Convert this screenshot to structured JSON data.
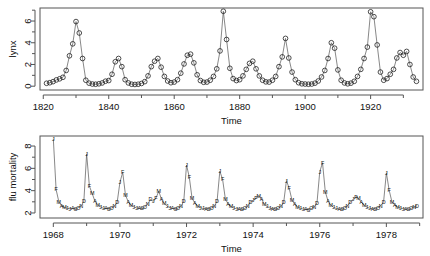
{
  "figure": {
    "panels": [
      "lynx",
      "flu-mortality"
    ]
  },
  "chart_data": [
    {
      "type": "line",
      "id": "lynx",
      "title": "",
      "xlabel": "Time",
      "ylabel": "lynx",
      "xlim": [
        1819,
        1936
      ],
      "ylim": [
        -0.35,
        7.2
      ],
      "grid": false,
      "legend": "none",
      "markers": "open-circle",
      "xticks": [
        1820,
        1840,
        1860,
        1880,
        1900,
        1920
      ],
      "xticklabels": [
        "1820",
        "1840",
        "1860",
        "1880",
        "1900",
        "1920"
      ],
      "xminorticks": [
        1830,
        1850,
        1870,
        1890,
        1910,
        1930
      ],
      "yticks": [
        0,
        2,
        4,
        6
      ],
      "yticklabels": [
        "0",
        "2",
        "4",
        "6"
      ],
      "yminorticks": [
        1,
        3,
        5,
        7
      ],
      "note": "annual log10 lynx trappings, 1821-1934",
      "x": [
        1821,
        1822,
        1823,
        1824,
        1825,
        1826,
        1827,
        1828,
        1829,
        1830,
        1831,
        1832,
        1833,
        1834,
        1835,
        1836,
        1837,
        1838,
        1839,
        1840,
        1841,
        1842,
        1843,
        1844,
        1845,
        1846,
        1847,
        1848,
        1849,
        1850,
        1851,
        1852,
        1853,
        1854,
        1855,
        1856,
        1857,
        1858,
        1859,
        1860,
        1861,
        1862,
        1863,
        1864,
        1865,
        1866,
        1867,
        1868,
        1869,
        1870,
        1871,
        1872,
        1873,
        1874,
        1875,
        1876,
        1877,
        1878,
        1879,
        1880,
        1881,
        1882,
        1883,
        1884,
        1885,
        1886,
        1887,
        1888,
        1889,
        1890,
        1891,
        1892,
        1893,
        1894,
        1895,
        1896,
        1897,
        1898,
        1899,
        1900,
        1901,
        1902,
        1903,
        1904,
        1905,
        1906,
        1907,
        1908,
        1909,
        1910,
        1911,
        1912,
        1913,
        1914,
        1915,
        1916,
        1917,
        1918,
        1919,
        1920,
        1921,
        1922,
        1923,
        1924,
        1925,
        1926,
        1927,
        1928,
        1929,
        1930,
        1931,
        1932,
        1933,
        1934
      ],
      "y": [
        0.27,
        0.32,
        0.42,
        0.58,
        0.68,
        0.82,
        1.45,
        2.8,
        3.9,
        5.95,
        4.9,
        2.55,
        0.55,
        0.28,
        0.2,
        0.18,
        0.22,
        0.3,
        0.46,
        0.52,
        1.1,
        2.25,
        2.55,
        1.8,
        0.6,
        0.3,
        0.18,
        0.16,
        0.18,
        0.25,
        0.42,
        0.95,
        1.8,
        2.3,
        2.55,
        1.75,
        0.9,
        0.48,
        0.32,
        0.38,
        0.6,
        1.2,
        2.05,
        2.85,
        2.95,
        2.15,
        1.05,
        0.52,
        0.36,
        0.38,
        0.55,
        0.9,
        1.6,
        3.25,
        6.9,
        4.3,
        1.65,
        0.7,
        0.52,
        0.6,
        0.95,
        1.55,
        2.1,
        2.3,
        1.6,
        0.95,
        0.55,
        0.4,
        0.38,
        0.55,
        0.9,
        1.8,
        2.7,
        4.4,
        2.6,
        1.3,
        0.6,
        0.32,
        0.22,
        0.2,
        0.18,
        0.2,
        0.28,
        0.48,
        0.85,
        1.45,
        2.55,
        4.0,
        3.5,
        1.5,
        0.55,
        0.3,
        0.22,
        0.28,
        0.45,
        0.9,
        1.55,
        2.55,
        3.6,
        6.85,
        6.4,
        3.8,
        1.3,
        0.55,
        0.7,
        1.1,
        1.55,
        2.6,
        3.1,
        2.85,
        3.2,
        2.0,
        0.85,
        0.45
      ]
    },
    {
      "type": "line",
      "id": "flu-mortality",
      "title": "",
      "xlabel": "Time",
      "ylabel": "flu mortality",
      "xlim": [
        1967.6,
        1979.1
      ],
      "ylim": [
        1.55,
        8.9
      ],
      "grid": false,
      "legend": "none",
      "markers": "month-letter",
      "month_letters": [
        "J",
        "F",
        "M",
        "A",
        "M",
        "J",
        "J",
        "A",
        "S",
        "O",
        "N",
        "D"
      ],
      "xticks": [
        1968,
        1970,
        1972,
        1974,
        1976,
        1978
      ],
      "xticklabels": [
        "1968",
        "1970",
        "1972",
        "1974",
        "1976",
        "1978"
      ],
      "xminorticks": [
        1969,
        1971,
        1973,
        1975,
        1977,
        1979
      ],
      "yticks": [
        2,
        4,
        6,
        8
      ],
      "yticklabels": [
        "2",
        "4",
        "6",
        "8"
      ],
      "yminorticks": [
        3,
        5,
        7
      ],
      "note": "monthly pneumonia and influenza deaths per 10000, US, 1968-1978",
      "x_start": 1968.0,
      "x_step": 0.0833333,
      "y": [
        8.65,
        4.1,
        3.0,
        2.65,
        2.5,
        2.42,
        2.38,
        2.4,
        2.33,
        2.48,
        2.62,
        3.05,
        7.3,
        4.4,
        3.75,
        3.05,
        2.75,
        2.55,
        2.42,
        2.4,
        2.38,
        2.45,
        2.6,
        2.95,
        4.75,
        5.65,
        3.6,
        3.0,
        2.7,
        2.55,
        2.45,
        2.42,
        2.4,
        2.55,
        2.8,
        3.2,
        3.05,
        3.35,
        3.95,
        3.2,
        2.85,
        2.6,
        2.48,
        2.4,
        2.35,
        2.45,
        2.6,
        3.05,
        6.3,
        5.2,
        3.3,
        2.9,
        2.62,
        2.48,
        2.4,
        2.38,
        2.36,
        2.45,
        2.6,
        3.05,
        5.75,
        5.0,
        3.25,
        2.8,
        2.58,
        2.45,
        2.38,
        2.35,
        2.32,
        2.42,
        2.58,
        3.0,
        3.15,
        3.3,
        3.55,
        3.25,
        2.8,
        2.58,
        2.45,
        2.38,
        2.34,
        2.42,
        2.58,
        2.95,
        4.9,
        4.2,
        3.15,
        2.78,
        2.55,
        2.42,
        2.35,
        2.32,
        2.3,
        2.4,
        2.55,
        2.9,
        5.7,
        6.5,
        3.9,
        3.05,
        2.7,
        2.5,
        2.4,
        2.35,
        2.33,
        2.45,
        2.65,
        3.0,
        3.2,
        3.45,
        3.3,
        2.95,
        2.7,
        2.52,
        2.42,
        2.38,
        2.35,
        2.48,
        2.65,
        3.0,
        5.6,
        4.05,
        3.0,
        2.75,
        2.55,
        2.45,
        2.38,
        2.35,
        2.32,
        2.42,
        2.55,
        2.65
      ],
      "peak_labels": [
        {
          "year": 1968,
          "month": "J",
          "value": 8.65
        },
        {
          "year": 1969,
          "month": "D",
          "value": 7.3
        },
        {
          "year": 1970,
          "month": "F",
          "value": 5.65
        },
        {
          "year": 1972,
          "month": "J",
          "value": 6.3
        },
        {
          "year": 1973,
          "month": "J",
          "value": 5.75
        },
        {
          "year": 1975,
          "month": "J",
          "value": 4.9
        },
        {
          "year": 1976,
          "month": "M",
          "value": 6.5
        },
        {
          "year": 1978,
          "month": "J",
          "value": 5.6
        }
      ]
    }
  ]
}
